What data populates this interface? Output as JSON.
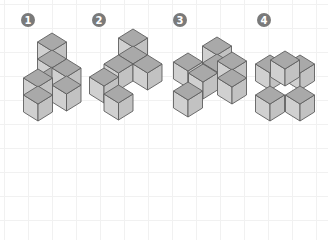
{
  "diagram": {
    "type": "isometric-cube-figures",
    "cube": {
      "half_width": 14.5,
      "top_half_height": 9,
      "vertical_height": 17
    },
    "colors": {
      "top_face": "#a9a9a9",
      "left_face": "#d0d0d0",
      "right_face": "#c2c2c2",
      "edge": "#5f5f5f",
      "badge": "#7a7a7a",
      "badge_text": "#ffffff",
      "grid": "#f1f1f1",
      "background": "#ffffff"
    },
    "figures": [
      {
        "label": "1",
        "badge": {
          "x": 28,
          "y": 20
        },
        "cubes": [
          [
            52,
            33
          ],
          [
            52,
            50
          ],
          [
            52,
            67
          ],
          [
            66.5,
            59
          ],
          [
            66.5,
            76
          ],
          [
            38,
            69
          ],
          [
            38,
            86
          ]
        ]
      },
      {
        "label": "2",
        "badge": {
          "x": 99,
          "y": 20
        },
        "cubes": [
          [
            133,
            29
          ],
          [
            133,
            46
          ],
          [
            118.5,
            55
          ],
          [
            147.5,
            55
          ],
          [
            104,
            68
          ],
          [
            118.5,
            85
          ]
        ]
      },
      {
        "label": "3",
        "badge": {
          "x": 180,
          "y": 20
        },
        "cubes": [
          [
            217,
            37
          ],
          [
            217,
            54
          ],
          [
            188,
            53
          ],
          [
            203,
            64
          ],
          [
            232,
            52
          ],
          [
            232,
            69
          ],
          [
            188,
            82
          ]
        ]
      },
      {
        "label": "4",
        "badge": {
          "x": 264,
          "y": 20
        },
        "cubes": [
          [
            270,
            55
          ],
          [
            300,
            55
          ],
          [
            285,
            51
          ],
          [
            270,
            86
          ],
          [
            300,
            86
          ]
        ]
      }
    ]
  }
}
